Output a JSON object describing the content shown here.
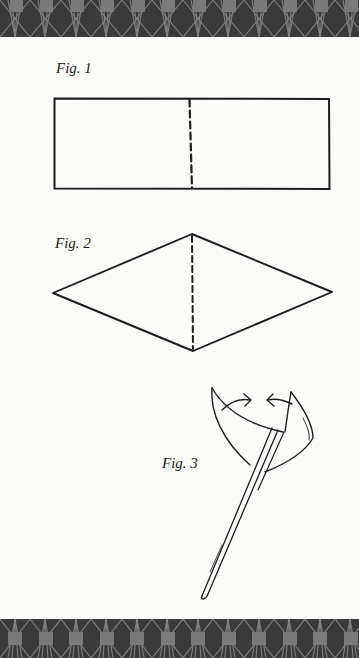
{
  "figures": [
    {
      "label": "Fig. 1",
      "shape": "rectangle-with-center-dashed-fold"
    },
    {
      "label": "Fig. 2",
      "shape": "diamond-with-vertical-dashed-fold"
    },
    {
      "label": "Fig. 3",
      "shape": "folded-cone-on-stick-with-arrows"
    }
  ],
  "colors": {
    "band": "#3a3a3a",
    "band_square": "#7a7a7a",
    "band_line": "#8c8c8c",
    "paper": "#fbfbfa",
    "ink": "#1d1d1d"
  }
}
